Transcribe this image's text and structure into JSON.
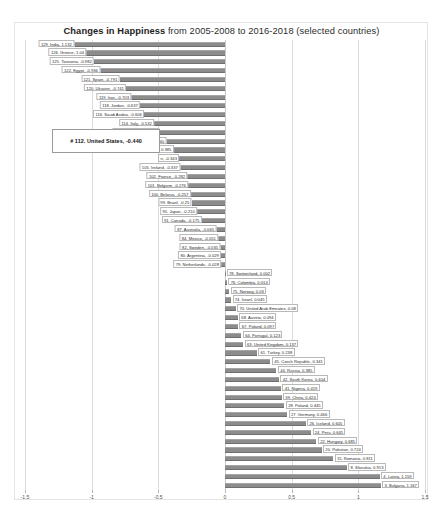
{
  "title": {
    "strong": "Changes in Happiness",
    "rest": " from 2005-2008 to 2016-2018 (selected countries)"
  },
  "callout": {
    "label": "# 112. United States, -0.440"
  },
  "axis": {
    "ticks": [
      "-1.5",
      "-1",
      "-0.5",
      "0",
      "0.5",
      "1",
      "1.5"
    ]
  },
  "chart_data": {
    "type": "bar",
    "orientation": "horizontal",
    "title": "Changes in Happiness from 2005-2008 to 2016-2018 (selected countries)",
    "xlabel": "",
    "ylabel": "",
    "xlim": [
      -1.5,
      1.5
    ],
    "xticks": [
      -1.5,
      -1,
      -0.5,
      0,
      0.5,
      1,
      1.5
    ],
    "grid": true,
    "legend": "none",
    "highlight": {
      "rank": 112,
      "country": "United States",
      "value": -0.44
    },
    "categories": [
      "129. India",
      "126. Greece",
      "125. Tanzania",
      "122. Egypt",
      "121. Spain",
      "120. Ukraine",
      "119. Iran",
      "118. Jordan",
      "116. Saudi Arabia",
      "114. Italy",
      "113. South Africa",
      "112. United States",
      "110. Yemen",
      "109. Malta",
      "105. Ireland",
      "102. France",
      "101. Belgium",
      "100. Belarus",
      "99. Brazil",
      "95. Japan",
      "91. Canada",
      "87. Australia",
      "84. Mexico",
      "82. Sweden",
      "80. Argentina",
      "79. Netherlands",
      "78. Switzerland",
      "76. Colombia",
      "75. Norway",
      "74. Israel",
      "70. United Arab Emirates",
      "68. Austria",
      "67. Poland",
      "64. Portugal",
      "63. United Kingdom",
      "61. Turkey",
      "45. Czech Republic",
      "44. Russia",
      "42. South Korea",
      "41. Nigeria",
      "39. China",
      "28. Poland",
      "27. Germany",
      "26. Iceland",
      "24. Peru",
      "22. Hungary",
      "20. Pakistan",
      "15. Romania",
      "8. Slovakia",
      "4. Latvia",
      "3. Bulgaria"
    ],
    "values": [
      -1.132,
      -1.04,
      -0.982,
      -0.936,
      -0.791,
      -0.741,
      -0.703,
      -0.637,
      -0.606,
      -0.532,
      -0.49,
      -0.44,
      -0.385,
      -0.343,
      -0.337,
      -0.282,
      -0.276,
      -0.257,
      -0.25,
      -0.21,
      -0.175,
      -0.065,
      -0.051,
      -0.035,
      -0.029,
      -0.028,
      0.002,
      0.014,
      0.03,
      0.045,
      0.08,
      0.094,
      0.097,
      0.123,
      0.137,
      0.238,
      0.341,
      0.385,
      0.404,
      0.419,
      0.424,
      0.445,
      0.466,
      0.605,
      0.645,
      0.685,
      0.724,
      0.811,
      0.913,
      1.159,
      1.167
    ],
    "labels": [
      "129. India, 1.132",
      "126. Greece, 1.04",
      "125. Tanzania, -0.982",
      "122. Egypt, -0.936",
      "121. Spain, -0.791",
      "120. Ukraine, -0.741",
      "119. Iran, -0.703",
      "118. Jordan, -0.637",
      "116. Saudi Arabia, -0.606",
      "114. Italy, -0.532",
      "113. South Africa, -0.49",
      "112. United States, -0.440",
      "0.385",
      "n, -0.343",
      "105. Ireland, -0.337",
      "102. France, -0.282",
      "101. Belgium, -0.276",
      "100. Belarus, -0.257",
      "99. Brazil, -0.25",
      "95. Japan, -0.210",
      "91. Canada, -0.175",
      "87. Australia, -0.065",
      "84. Mexico, -0.051",
      "82. Sweden, -0.035",
      "80. Argentina, -0.029",
      "79. Netherlands, -0.028",
      "78. Switzerland, 0.002",
      "76. Colombia, 0.014",
      "75. Norway, 0.03",
      "74. Israel, 0.045",
      "70. United Arab Emirates, 0.08",
      "68. Austria, 0.094",
      "67. Poland, 0.097",
      "64. Portugal, 0.123",
      "63. United Kingdom, 0.137",
      "61. Turkey, 0.238",
      "45. Czech Republic, 0.341",
      "44. Russia, 0.385",
      "42. South Korea, 0.404",
      "41. Nigeria, 0.419",
      "39. China, 0.424",
      "28. Poland, 0.445",
      "27. Germany, 0.466",
      "26. Iceland, 0.605",
      "24. Peru, 0.645",
      "22. Hungary, 0.685",
      "20. Pakistan, 0.724",
      "15. Romania, 0.811",
      "8. Slovakia, 0.913",
      "4. Latvia, 1.159",
      "3. Bulgaria, 1.167"
    ],
    "bar_color": "#8c8c8c"
  }
}
